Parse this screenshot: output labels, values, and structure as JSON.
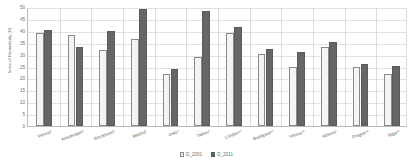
{
  "chart_data": {
    "type": "bar",
    "title": "",
    "subtitle": "",
    "xlabel": "",
    "ylabel": "Index of Dissimilarity (D)",
    "ylim": [
      0,
      50
    ],
    "ytick_values": [
      0,
      5,
      10,
      15,
      20,
      25,
      30,
      35,
      40,
      45,
      50
    ],
    "ytick_labels": [
      "0",
      "5",
      "10",
      "15",
      "20",
      "25",
      "30",
      "35",
      "40",
      "45",
      "50"
    ],
    "grid": "horizontal-and-vertical",
    "legend_position": "bottom-center",
    "categories": [
      "Vienna*",
      "Amsterdam*",
      "Stockholm*",
      "Madrid*",
      "Oslo*",
      "Tallinn*",
      "London**",
      "Budapest**",
      "Vilnius**",
      "Athens*",
      "Prague**",
      "Riga**"
    ],
    "series": [
      {
        "name": "D_2001",
        "color": "#f4f4f4",
        "border_color": "#8a8a8a",
        "values": [
          39.0,
          38.1,
          32.1,
          36.4,
          21.8,
          29.1,
          39.0,
          30.1,
          25.0,
          33.1,
          25.0,
          22.0
        ]
      },
      {
        "name": "D_2011",
        "color": "#666666",
        "border_color": "#5a5a5a",
        "values": [
          40.4,
          33.2,
          40.0,
          49.2,
          24.1,
          48.2,
          41.8,
          32.3,
          31.1,
          35.1,
          26.1,
          25.1
        ]
      }
    ]
  },
  "legend": {
    "entries": [
      {
        "label": "D_2001"
      },
      {
        "label": "D_2011"
      }
    ]
  },
  "colors": {
    "series_2001": "#f4f4f4",
    "series_2011": "#666666",
    "axis": "#b9b9b9",
    "gridline": "#e2e2e2",
    "text": "#6d6d6d",
    "background": "#ffffff"
  }
}
